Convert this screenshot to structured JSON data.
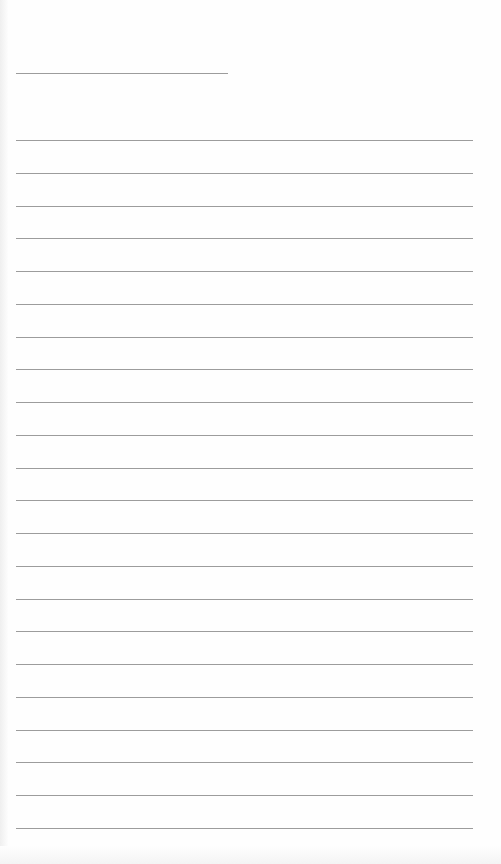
{
  "page": {
    "type": "lined-notebook-page",
    "background_color": "#fefefe",
    "line_color": "#9c9c9c",
    "title_line": {
      "x": 16,
      "y": 73,
      "width": 212
    },
    "ruled_lines": {
      "count": 22,
      "first_y": 140,
      "spacing": 32.76,
      "x_start": 16,
      "x_end": 473
    }
  }
}
